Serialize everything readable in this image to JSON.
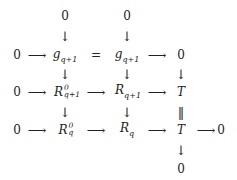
{
  "diagram": {
    "type": "commutative-diagram",
    "nodes": {
      "top0_a": "0",
      "top0_b": "0",
      "r1_zero_left": "0",
      "g_left": {
        "base": "g",
        "sub": "q+1"
      },
      "equals": "=",
      "g_right": {
        "base": "g",
        "sub": "q+1"
      },
      "r1_zero_right": "0",
      "r2_zero_left": "0",
      "R0_q1": {
        "base": "R",
        "sup": "0",
        "sub": "q+1"
      },
      "R_q1": {
        "base": "R",
        "sub": "q+1"
      },
      "T_top": "T",
      "r3_zero_left": "0",
      "R0_q": {
        "base": "R",
        "sup": "0",
        "sub": "q"
      },
      "R_q": {
        "base": "R",
        "sub": "q"
      },
      "T_bottom": "T",
      "r3_zero_right": "0",
      "bottom0": "0"
    },
    "arrows": {
      "right": "⟶",
      "down": "↓",
      "equal_vertical": "‖"
    }
  }
}
